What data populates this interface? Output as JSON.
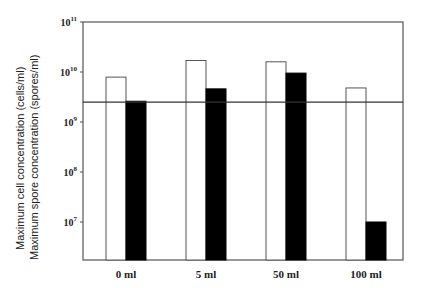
{
  "chart_data": {
    "type": "bar",
    "title": "",
    "xlabel": "",
    "ylabel_lines": [
      "Maximum cell concentration (cells/ml)",
      "Maximum spore concentration (spores/ml)"
    ],
    "yscale": "log",
    "ylim": [
      1700000,
      100000000000
    ],
    "yticks": [
      {
        "base": "10",
        "exp": "11",
        "value": 100000000000
      },
      {
        "base": "10",
        "exp": "10",
        "value": 10000000000
      },
      {
        "base": "10",
        "exp": "9",
        "value": 1000000000
      },
      {
        "base": "10",
        "exp": "8",
        "value": 100000000
      },
      {
        "base": "10",
        "exp": "7",
        "value": 10000000
      }
    ],
    "categories": [
      "0 ml",
      "5 ml",
      "50 ml",
      "100 ml"
    ],
    "series": [
      {
        "name": "Maximum cell concentration",
        "fill": "#ffffff",
        "stroke": "#555555",
        "values": [
          7900000000,
          17000000000,
          16000000000,
          4800000000
        ]
      },
      {
        "name": "Maximum spore concentration",
        "fill": "#000000",
        "stroke": "#000000",
        "values": [
          2600000000,
          4600000000,
          9500000000,
          10000000
        ]
      }
    ],
    "reference_line": {
      "value": 2500000000,
      "color": "#333333"
    },
    "grid": false,
    "legend": null
  }
}
